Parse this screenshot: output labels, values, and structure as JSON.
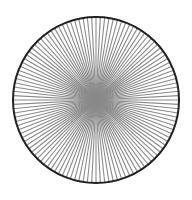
{
  "figure": {
    "type": "radial-spoke-pattern",
    "center": [
      96,
      100
    ],
    "radius": 83,
    "spoke_count": 120,
    "spoke_color": "#8a8a8a",
    "spoke_width": 1.1,
    "outline_color": "#222222",
    "outline_width": 2,
    "background": "#ffffff"
  }
}
